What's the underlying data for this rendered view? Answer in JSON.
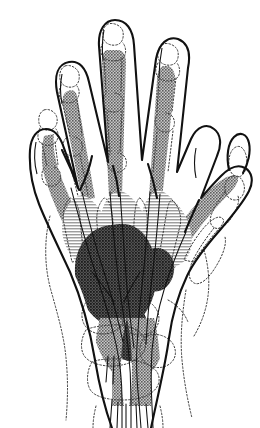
{
  "figure": {
    "view": "dorsal outline with palmar soft-tissue shading",
    "caption": "",
    "background_color": "#ffffff",
    "canvas": {
      "width": 260,
      "height": 428
    }
  },
  "palette": {
    "outline": "#111111",
    "bone_outline": "#4a4a4a",
    "shade_light": "#b3b3b3",
    "shade_medium": "#8c8c8c",
    "shade_dark": "#4d4d4d",
    "tendon_line": "#111111",
    "background": "#ffffff"
  },
  "regions": [
    {
      "id": "digit-2-band",
      "label": "index finger shaded band",
      "tone": "medium"
    },
    {
      "id": "digit-3-band",
      "label": "middle finger shaded band",
      "tone": "medium"
    },
    {
      "id": "digit-4-band",
      "label": "ring finger shaded band",
      "tone": "medium"
    },
    {
      "id": "digit-5-band",
      "label": "little finger shaded band",
      "tone": "medium"
    },
    {
      "id": "thumb-band",
      "label": "thumb shaded band",
      "tone": "medium"
    },
    {
      "id": "metacarpal-lobe-1",
      "label": "shaded lobe over second intermetacarpal space",
      "tone": "light"
    },
    {
      "id": "metacarpal-lobe-2",
      "label": "shaded lobe over third intermetacarpal space",
      "tone": "light"
    },
    {
      "id": "metacarpal-lobe-3",
      "label": "shaded lobe over fourth intermetacarpal space",
      "tone": "light"
    },
    {
      "id": "central-palm",
      "label": "dark central palmar region",
      "tone": "dark"
    },
    {
      "id": "wrist-band",
      "label": "wrist and carpal shaded band",
      "tone": "medium"
    }
  ],
  "structures": [
    {
      "id": "hand-outline",
      "label": "hand and finger outline"
    },
    {
      "id": "phalanx-bones",
      "label": "dotted phalangeal bone outlines"
    },
    {
      "id": "metacarpal-bones",
      "label": "dotted metacarpal bone outlines"
    },
    {
      "id": "carpal-bones",
      "label": "dotted carpal bone outlines"
    },
    {
      "id": "tendon-lines",
      "label": "tendon and neurovascular lines"
    },
    {
      "id": "thumb-nail",
      "label": "thumb nail outline"
    }
  ],
  "labels": {
    "annotations": []
  }
}
